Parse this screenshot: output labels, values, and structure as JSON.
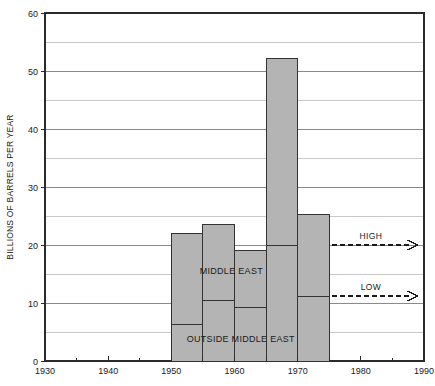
{
  "chart_data": {
    "type": "bar",
    "title": "",
    "subtitle": "",
    "xlabel": "",
    "ylabel": "BILLIONS OF BARRELS PER YEAR",
    "xlim": [
      1930,
      1990
    ],
    "ylim": [
      0,
      60
    ],
    "x_ticks_major": [
      1930,
      1940,
      1950,
      1960,
      1970,
      1980,
      1990
    ],
    "x_ticks_minor": [
      1935,
      1945,
      1955,
      1965,
      1975,
      1985
    ],
    "y_ticks_major": [
      0,
      10,
      20,
      30,
      40,
      50,
      60
    ],
    "y_ticks_minor": [
      5,
      15,
      25,
      35,
      45,
      55
    ],
    "grid": "horizontal",
    "grid_minor": true,
    "legend": "inline-labels",
    "stacked": true,
    "bar_fill": "#b4b4b4",
    "bar_stroke": "#333333",
    "categories": [
      "1950-1955",
      "1955-1960",
      "1960-1965",
      "1965-1970",
      "1970-1975"
    ],
    "bar_spans": [
      {
        "start": 1950,
        "end": 1955
      },
      {
        "start": 1955,
        "end": 1960
      },
      {
        "start": 1960,
        "end": 1965
      },
      {
        "start": 1965,
        "end": 1970
      },
      {
        "start": 1970,
        "end": 1975
      }
    ],
    "series": [
      {
        "name": "OUTSIDE MIDDLE EAST",
        "label_text": "OUTSIDE MIDDLE EAST",
        "values": [
          6.3,
          10.5,
          9.2,
          20.0,
          11.2
        ]
      },
      {
        "name": "MIDDLE EAST",
        "label_text": "MIDDLE EAST",
        "values": [
          15.7,
          13.0,
          9.8,
          32.2,
          14.1
        ]
      }
    ],
    "totals": [
      22.0,
      23.5,
      19.0,
      52.2,
      25.3
    ],
    "annotations": [
      {
        "name": "high",
        "label": "HIGH",
        "y_value": 20.0,
        "x_start": 1975,
        "x_end": 1989,
        "style": "dashed-arrow"
      },
      {
        "name": "low",
        "label": "LOW",
        "y_value": 11.2,
        "x_start": 1975,
        "x_end": 1989,
        "style": "dashed-arrow"
      }
    ],
    "inline_labels": [
      {
        "name": "middle-east",
        "text": "MIDDLE EAST",
        "x_value": 1959.5,
        "y_value": 15.0
      },
      {
        "name": "outside-middle-east",
        "text": "OUTSIDE MIDDLE EAST",
        "x_value": 1961.0,
        "y_value": 3.2
      }
    ]
  },
  "axis": {
    "y_title": "BILLIONS OF BARRELS PER YEAR",
    "y_tick_labels": [
      "0",
      "10",
      "20",
      "30",
      "40",
      "50",
      "60"
    ],
    "x_tick_labels": [
      "1930",
      "1940",
      "1950",
      "1960",
      "1970",
      "1980",
      "1990"
    ]
  },
  "colors": {
    "bar_fill": "#b4b4b4",
    "bar_stroke": "#333333",
    "grid_major": "#8a8a8a",
    "grid_minor": "#c9c9c9",
    "frame": "#2b2b2b",
    "text": "#1a1a1a"
  }
}
